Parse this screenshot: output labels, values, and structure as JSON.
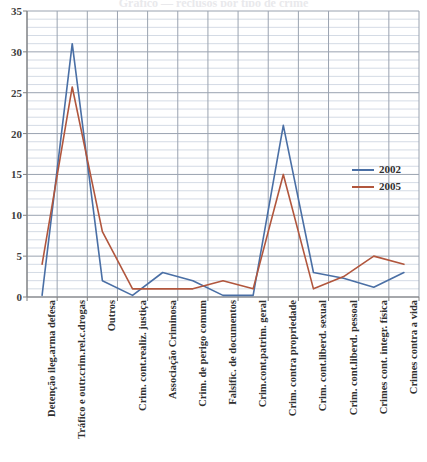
{
  "title_sliver": "Gráfico — reclusos por tipo de crime",
  "chart_data": {
    "type": "line",
    "title": "",
    "xlabel": "",
    "ylabel": "",
    "ylim": [
      0,
      35
    ],
    "ytick_values": [
      0,
      5,
      10,
      15,
      20,
      25,
      30,
      35
    ],
    "ytick_labels": [
      "0",
      "5",
      "10",
      "15",
      "20",
      "25",
      "30",
      "35"
    ],
    "grid": {
      "major_step": 5,
      "minor_step": 1,
      "horizontal": true,
      "vertical": true
    },
    "legend": {
      "position": "right-middle",
      "entries": [
        {
          "name": "2002",
          "color": "#4a6fa5"
        },
        {
          "name": "2005",
          "color": "#b1563d"
        }
      ]
    },
    "categories": [
      "Detenção ileg.arma defesa",
      "Tráfico e outr.crim.rel.c.drogas",
      "Outros",
      "Crim. cont.realiz. justiça",
      "Associação Criminosa",
      "Crim. de perigo comum",
      "Falsific. de documentos",
      "Crim.cont.patrim. geral",
      "Crim. contra propriedade",
      "Crim. cont.liberd. sexual",
      "Crim. cont.liberd. pessoal",
      "Crimes cont. integr. física",
      "Crimes contra a vida"
    ],
    "series": [
      {
        "name": "2002",
        "color": "#4a6fa5",
        "values": [
          0.2,
          31,
          2,
          0.2,
          3,
          2,
          0.2,
          0.2,
          21,
          3,
          2.3,
          1.2,
          3
        ]
      },
      {
        "name": "2005",
        "color": "#b1563d",
        "values": [
          4,
          25.7,
          8,
          1,
          1,
          1,
          2,
          1,
          15,
          1,
          2.5,
          5,
          4
        ]
      }
    ]
  },
  "colors": {
    "series_2002": "#4a6fa5",
    "series_2005": "#b1563d",
    "grid_major": "#9aa3b0",
    "grid_minor": "#c9d2de",
    "axis": "#808080",
    "text": "#2f2f2f",
    "background": "#ffffff"
  }
}
